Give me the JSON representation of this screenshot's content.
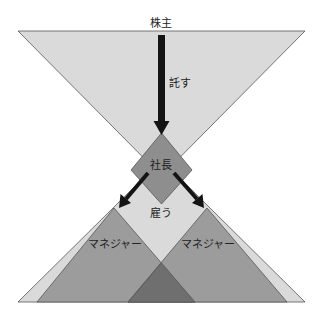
{
  "diagram": {
    "labels": {
      "shareholders": "株主",
      "entrust": "託す",
      "president": "社長",
      "hire": "雇う",
      "manager_left": "マネジャー",
      "manager_right": "マネジャー"
    },
    "colors": {
      "light_triangle": "#dadada",
      "manager_triangle": "#9c9c9c",
      "president_diamond": "#8e8e8e",
      "overlap": "#6f6f6f",
      "arrow": "#141414",
      "outline": "#555555"
    }
  }
}
